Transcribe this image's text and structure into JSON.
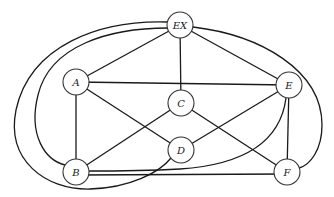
{
  "diagram": {
    "type": "graph",
    "nodes": [
      {
        "id": "EX",
        "label": "EX",
        "x": 180,
        "y": 25
      },
      {
        "id": "A",
        "label": "A",
        "x": 76,
        "y": 82
      },
      {
        "id": "C",
        "label": "C",
        "x": 181,
        "y": 103
      },
      {
        "id": "E",
        "label": "E",
        "x": 289,
        "y": 85
      },
      {
        "id": "D",
        "label": "D",
        "x": 181,
        "y": 150
      },
      {
        "id": "B",
        "label": "B",
        "x": 76,
        "y": 172
      },
      {
        "id": "F",
        "label": "F",
        "x": 287,
        "y": 172
      }
    ],
    "edges": [
      {
        "from": "EX",
        "to": "A",
        "shape": "straight"
      },
      {
        "from": "EX",
        "to": "C",
        "shape": "straight"
      },
      {
        "from": "EX",
        "to": "E",
        "shape": "straight"
      },
      {
        "from": "EX",
        "to": "F",
        "shape": "curve-right"
      },
      {
        "from": "EX",
        "to": "B",
        "shape": "curve-left-inner"
      },
      {
        "from": "EX",
        "to": "D",
        "shape": "curve-left-outer"
      },
      {
        "from": "A",
        "to": "E",
        "shape": "straight"
      },
      {
        "from": "A",
        "to": "B",
        "shape": "straight"
      },
      {
        "from": "A",
        "to": "D",
        "shape": "straight"
      },
      {
        "from": "C",
        "to": "B",
        "shape": "straight"
      },
      {
        "from": "C",
        "to": "F",
        "shape": "straight"
      },
      {
        "from": "E",
        "to": "D",
        "shape": "straight"
      },
      {
        "from": "E",
        "to": "F",
        "shape": "straight"
      },
      {
        "from": "E",
        "to": "B",
        "shape": "curve-bottom"
      },
      {
        "from": "B",
        "to": "F",
        "shape": "straight"
      }
    ]
  }
}
